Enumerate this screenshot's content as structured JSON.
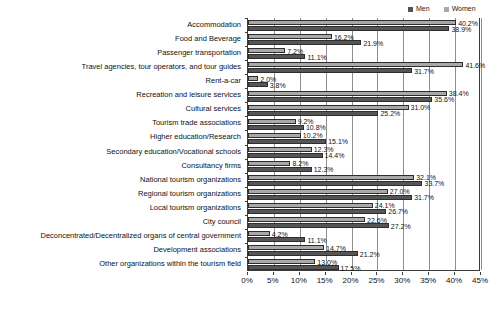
{
  "chart_data": {
    "type": "bar",
    "orientation": "horizontal",
    "title": "",
    "xlabel": "",
    "ylabel": "",
    "xlim": [
      0,
      45
    ],
    "xticks": [
      "0%",
      "5%",
      "10%",
      "15%",
      "20%",
      "25%",
      "30%",
      "35%",
      "40%",
      "45%"
    ],
    "xtick_values": [
      0,
      5,
      10,
      15,
      20,
      25,
      30,
      35,
      40,
      45
    ],
    "grid": true,
    "legend_position": "top-right",
    "categories": [
      "Accommodation",
      "Food and Beverage",
      "Passenger transportation",
      "Travel agencies, tour operators, and tour guides",
      "Rent-a-car",
      "Recreation and leisure services",
      "Cultural services",
      "Tourism trade associations",
      "Higher education/Research",
      "Secondary education/Vocational schools",
      "Consultancy firms",
      "National tourism organizations",
      "Regional tourism organizations",
      "Local tourism organizations",
      "City council",
      "Deconcentrated/Decentralized organs of central government",
      "Development associations",
      "Other organizations within the tourism field"
    ],
    "series": [
      {
        "name": "Women",
        "color": "#a8a8a8",
        "values": [
          40.2,
          16.2,
          7.2,
          41.6,
          2.0,
          38.4,
          31.0,
          9.2,
          10.2,
          12.3,
          8.2,
          32.1,
          27.0,
          24.1,
          22.6,
          4.2,
          14.7,
          13.0
        ],
        "labels": [
          "40.2%",
          "16.2%",
          "7.2%",
          "41.6%",
          "2.0%",
          "38.4%",
          "31.0%",
          "9.2%",
          "10.2%",
          "12.3%",
          "8.2%",
          "32.1%",
          "27.0%",
          "24.1%",
          "22.6%",
          "4.2%",
          "14.7%",
          "13.0%"
        ]
      },
      {
        "name": "Men",
        "color": "#555555",
        "values": [
          38.9,
          21.9,
          11.1,
          31.7,
          3.8,
          35.6,
          25.2,
          10.8,
          15.1,
          14.4,
          12.3,
          33.7,
          31.7,
          26.7,
          27.2,
          11.1,
          21.2,
          17.5
        ],
        "labels": [
          "38.9%",
          "21.9%",
          "11.1%",
          "31.7%",
          "3.8%",
          "35.6%",
          "25.2%",
          "10.8%",
          "15.1%",
          "14.4%",
          "12.3%",
          "33.7%",
          "31.7%",
          "26.7%",
          "27.2%",
          "11.1%",
          "21.2%",
          "17.5%"
        ]
      }
    ]
  },
  "legend": {
    "entries": [
      {
        "label": "Men",
        "color": "#555555"
      },
      {
        "label": "Women",
        "color": "#a8a8a8"
      }
    ]
  }
}
